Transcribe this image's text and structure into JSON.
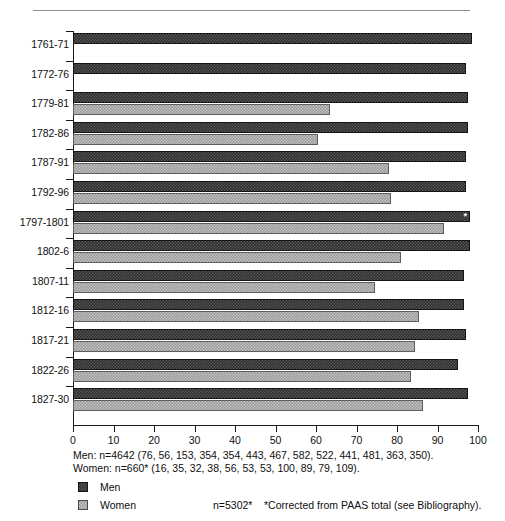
{
  "chart_data": {
    "type": "bar",
    "orientation": "horizontal",
    "title": "",
    "xlabel": "",
    "ylabel": "",
    "xlim": [
      0,
      100
    ],
    "xticks": [
      0,
      10,
      20,
      30,
      40,
      50,
      60,
      70,
      80,
      90,
      100
    ],
    "grid": false,
    "legend_position": "bottom-left",
    "categories": [
      "1761-71",
      "1772-76",
      "1779-81",
      "1782-86",
      "1787-91",
      "1792-96",
      "1797-1801",
      "1802-6",
      "1807-11",
      "1812-16",
      "1817-21",
      "1822-26",
      "1827-30"
    ],
    "series": [
      {
        "name": "Men",
        "values": [
          98.5,
          97.0,
          97.5,
          97.5,
          97.0,
          97.0,
          98.0,
          98.0,
          96.5,
          96.5,
          97.0,
          95.0,
          97.5
        ]
      },
      {
        "name": "Women",
        "values": [
          null,
          null,
          63.5,
          60.5,
          78.0,
          78.5,
          91.5,
          81.0,
          74.5,
          85.5,
          84.5,
          83.5,
          86.5
        ]
      }
    ],
    "annotations": [
      {
        "category": "1797-1801",
        "series": "Men",
        "marker": "*"
      }
    ]
  },
  "axis": {
    "tick_labels": [
      "0",
      "10",
      "20",
      "30",
      "40",
      "50",
      "60",
      "70",
      "80",
      "90",
      "100"
    ]
  },
  "footnotes": {
    "men": "Men: n=4642 (76, 56, 153, 354, 354, 443, 467, 582, 522, 441, 481, 363, 350).",
    "women": "Women: n=660* (16, 35, 32, 38, 56, 53, 53, 100, 89, 79, 109)."
  },
  "legend": {
    "items": [
      {
        "label": "Men",
        "n": "",
        "swatch": "dark-checker-swatch",
        "color": "#2f2f2f"
      },
      {
        "label": "Women",
        "n": "n=5302*",
        "swatch": "light-checker-swatch",
        "color": "#9d9d9d"
      }
    ],
    "note": "*Corrected from PAAS total (see Bibliography)."
  }
}
